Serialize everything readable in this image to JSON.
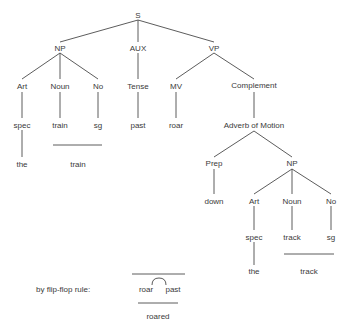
{
  "tree": {
    "root": "S",
    "np": {
      "label": "NP",
      "art": "Art",
      "noun": "Noun",
      "no": "No",
      "spec": "spec",
      "train": "train",
      "sg": "sg",
      "the": "the",
      "merged": "train"
    },
    "aux": {
      "label": "AUX",
      "tense": "Tense",
      "past": "past"
    },
    "vp": {
      "label": "VP",
      "mv": "MV",
      "roar": "roar",
      "complement": "Complement",
      "adverb": "Adverb of Motion",
      "prep": "Prep",
      "down": "down",
      "np": {
        "label": "NP",
        "art": "Art",
        "noun": "Noun",
        "no": "No",
        "spec": "spec",
        "track": "track",
        "sg": "sg",
        "the": "the",
        "merged": "track"
      }
    }
  },
  "flip_flop": {
    "caption": "by flip-flop rule:",
    "left": "roar",
    "right": "past",
    "result": "roared"
  }
}
